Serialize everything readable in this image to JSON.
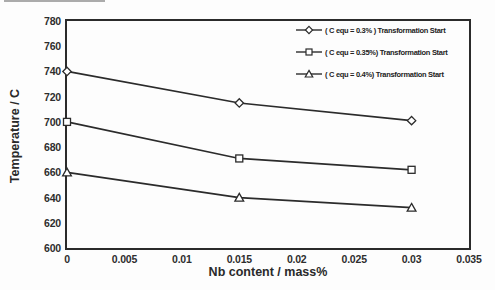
{
  "chart_data": {
    "type": "line",
    "title": "",
    "xlabel": "Nb content / mass%",
    "ylabel": "Temperature / C",
    "xlim": [
      0,
      0.035
    ],
    "ylim": [
      600,
      780
    ],
    "xtick_labels": [
      "0",
      "0.005",
      "0.01",
      "0.015",
      "0.02",
      "0.025",
      "0.03",
      "0.035"
    ],
    "xtick_values": [
      0,
      0.005,
      0.01,
      0.015,
      0.02,
      0.025,
      0.03,
      0.035
    ],
    "ytick_values": [
      600,
      620,
      640,
      660,
      680,
      700,
      720,
      740,
      760,
      780
    ],
    "x": [
      0,
      0.015,
      0.03
    ],
    "series": [
      {
        "name": "( C equ = 0.3% ) Transformation Start",
        "marker": "diamond",
        "values": [
          740,
          715,
          701
        ]
      },
      {
        "name": "( C equ = 0.35%) Transformation Start",
        "marker": "square",
        "values": [
          700,
          671,
          662
        ]
      },
      {
        "name": "( C equ = 0.4%) Transformation Start",
        "marker": "triangle",
        "values": [
          660,
          640,
          632
        ]
      }
    ],
    "grid": false,
    "legend_position": "top-right-inside",
    "line_color": "#2b2b2b",
    "marker_fill": "#ffffff",
    "background_color": "#fdfdfd"
  }
}
